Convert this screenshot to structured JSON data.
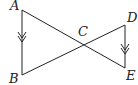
{
  "diagram": {
    "points": [
      {
        "label": "A",
        "x": 22,
        "y": 10,
        "lx": 10,
        "ly": 10
      },
      {
        "label": "B",
        "x": 22,
        "y": 75,
        "lx": 9,
        "ly": 82
      },
      {
        "label": "C",
        "x": 82,
        "y": 45,
        "lx": 78,
        "ly": 36
      },
      {
        "label": "D",
        "x": 125,
        "y": 25,
        "lx": 127,
        "ly": 22
      },
      {
        "label": "E",
        "x": 125,
        "y": 68,
        "lx": 126,
        "ly": 80
      }
    ],
    "segments": [
      [
        "A",
        "B"
      ],
      [
        "A",
        "E"
      ],
      [
        "B",
        "D"
      ],
      [
        "D",
        "E"
      ]
    ],
    "parallel_marks": [
      "AB",
      "DE"
    ],
    "stroke_color": "#222222"
  }
}
